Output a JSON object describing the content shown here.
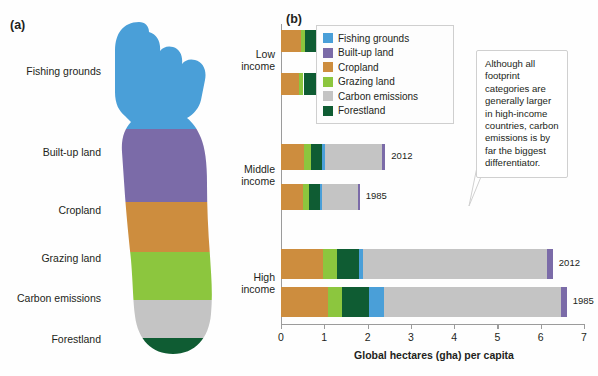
{
  "panels": {
    "a_letter": "(a)",
    "b_letter": "(b)"
  },
  "colors": {
    "fishing_grounds": "#4a9fd8",
    "built_up_land": "#7b6ba8",
    "cropland": "#cd8d3e",
    "grazing_land": "#8cc63e",
    "carbon_emissions": "#c4c4c4",
    "forestland": "#0f5c33",
    "axis": "#9b9b9b",
    "text": "#231f20"
  },
  "foot_diagram": {
    "labels": [
      {
        "text": "Fishing grounds",
        "color_key": "fishing_grounds"
      },
      {
        "text": "Built-up land",
        "color_key": "built_up_land"
      },
      {
        "text": "Cropland",
        "color_key": "cropland"
      },
      {
        "text": "Grazing land",
        "color_key": "grazing_land"
      },
      {
        "text": "Carbon emissions",
        "color_key": "carbon_emissions"
      },
      {
        "text": "Forestland",
        "color_key": "forestland"
      }
    ]
  },
  "legend": {
    "entries": [
      {
        "label": "Fishing grounds",
        "color": "#4a9fd8"
      },
      {
        "label": "Built-up land",
        "color": "#7b6ba8"
      },
      {
        "label": "Cropland",
        "color": "#cd8d3e"
      },
      {
        "label": "Grazing land",
        "color": "#8cc63e"
      },
      {
        "label": "Carbon emissions",
        "color": "#c4c4c4"
      },
      {
        "label": "Forestland",
        "color": "#0f5c33"
      }
    ]
  },
  "callout": {
    "text": "Although all footprint categories are generally larger in high-income countries, carbon emissions is by far the biggest differentiator."
  },
  "chart_data": {
    "type": "bar",
    "orientation": "horizontal",
    "stacked": true,
    "title": "",
    "xlabel": "Global hectares (gha) per capita",
    "ylabel": "",
    "xlim": [
      0,
      7
    ],
    "xticks": [
      0,
      1,
      2,
      3,
      4,
      5,
      6,
      7
    ],
    "xtick_labels": [
      "0",
      "1",
      "2",
      "3",
      "4",
      "5",
      "6",
      "7"
    ],
    "grid": false,
    "legend_position": "top-center",
    "series": [
      {
        "name": "Cropland",
        "color": "#cd8d3e"
      },
      {
        "name": "Grazing land",
        "color": "#8cc63e"
      },
      {
        "name": "Forestland",
        "color": "#0f5c33"
      },
      {
        "name": "Fishing grounds",
        "color": "#4a9fd8"
      },
      {
        "name": "Carbon emissions",
        "color": "#c4c4c4"
      },
      {
        "name": "Built-up land",
        "color": "#7b6ba8"
      }
    ],
    "groups": [
      {
        "label": "Low\nincome",
        "label_line1": "Low",
        "label_line2": "income",
        "bars": [
          {
            "year": "2012",
            "total": 1.05,
            "segments": [
              {
                "name": "Cropland",
                "value": 0.46
              },
              {
                "name": "Grazing land",
                "value": 0.1
              },
              {
                "name": "Forestland",
                "value": 0.32
              },
              {
                "name": "Fishing grounds",
                "value": 0.02
              },
              {
                "name": "Carbon emissions",
                "value": 0.1
              },
              {
                "name": "Built-up land",
                "value": 0.05
              }
            ]
          },
          {
            "year": "1985",
            "total": 0.98,
            "segments": [
              {
                "name": "Cropland",
                "value": 0.41
              },
              {
                "name": "Grazing land",
                "value": 0.11
              },
              {
                "name": "Forestland",
                "value": 0.31
              },
              {
                "name": "Fishing grounds",
                "value": 0.02
              },
              {
                "name": "Carbon emissions",
                "value": 0.09
              },
              {
                "name": "Built-up land",
                "value": 0.04
              }
            ]
          }
        ]
      },
      {
        "label": "Middle\nincome",
        "label_line1": "Middle",
        "label_line2": "income",
        "bars": [
          {
            "year": "2012",
            "total": 2.41,
            "segments": [
              {
                "name": "Cropland",
                "value": 0.52
              },
              {
                "name": "Grazing land",
                "value": 0.18
              },
              {
                "name": "Forestland",
                "value": 0.25
              },
              {
                "name": "Fishing grounds",
                "value": 0.06
              },
              {
                "name": "Carbon emissions",
                "value": 1.32
              },
              {
                "name": "Built-up land",
                "value": 0.08
              }
            ]
          },
          {
            "year": "1985",
            "total": 1.82,
            "segments": [
              {
                "name": "Cropland",
                "value": 0.5
              },
              {
                "name": "Grazing land",
                "value": 0.14
              },
              {
                "name": "Forestland",
                "value": 0.25
              },
              {
                "name": "Fishing grounds",
                "value": 0.06
              },
              {
                "name": "Carbon emissions",
                "value": 0.83
              },
              {
                "name": "Built-up land",
                "value": 0.04
              }
            ]
          }
        ]
      },
      {
        "label": "High\nincome",
        "label_line1": "High",
        "label_line2": "income",
        "bars": [
          {
            "year": "2012",
            "total": 6.28,
            "segments": [
              {
                "name": "Cropland",
                "value": 0.98
              },
              {
                "name": "Grazing land",
                "value": 0.31
              },
              {
                "name": "Forestland",
                "value": 0.52
              },
              {
                "name": "Fishing grounds",
                "value": 0.09
              },
              {
                "name": "Carbon emissions",
                "value": 4.25
              },
              {
                "name": "Built-up land",
                "value": 0.13
              }
            ]
          },
          {
            "year": "1985",
            "total": 6.6,
            "segments": [
              {
                "name": "Cropland",
                "value": 1.08
              },
              {
                "name": "Grazing land",
                "value": 0.34
              },
              {
                "name": "Forestland",
                "value": 0.62
              },
              {
                "name": "Fishing grounds",
                "value": 0.34
              },
              {
                "name": "Carbon emissions",
                "value": 4.1
              },
              {
                "name": "Built-up land",
                "value": 0.12
              }
            ]
          }
        ]
      }
    ]
  }
}
